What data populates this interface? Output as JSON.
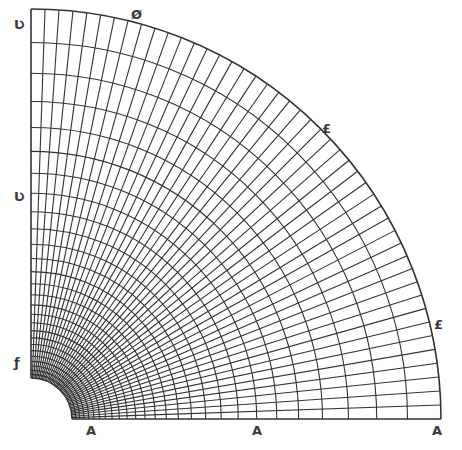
{
  "diagram": {
    "type": "polar-quarter-annulus-mesh",
    "center": [
      31,
      419
    ],
    "inner_radius": 41,
    "outer_radius": 410,
    "arc_count": 27,
    "radial_divisions": 46,
    "arc_grading_ratio": 0.917,
    "line_color": "#333333",
    "background": "#ffffff"
  },
  "markers": [
    {
      "id": "marker-top-left",
      "symbol": "Ʋ",
      "x": 14,
      "y": 18,
      "edge": "y-axis-top"
    },
    {
      "id": "marker-left-mid",
      "symbol": "Ʋ",
      "x": 14,
      "y": 190,
      "edge": "y-axis-mid"
    },
    {
      "id": "marker-left-inner",
      "symbol": "ƒ",
      "x": 14,
      "y": 356,
      "edge": "y-axis-inner"
    },
    {
      "id": "marker-bottom-inner",
      "symbol": "A",
      "x": 86,
      "y": 424,
      "edge": "x-axis-inner"
    },
    {
      "id": "marker-bottom-mid",
      "symbol": "A",
      "x": 252,
      "y": 424,
      "edge": "x-axis-mid"
    },
    {
      "id": "marker-bottom-right",
      "symbol": "A",
      "x": 432,
      "y": 424,
      "edge": "x-axis-outer"
    },
    {
      "id": "marker-arc-top",
      "symbol": "Ø",
      "x": 131,
      "y": 8,
      "edge": "outer-arc"
    },
    {
      "id": "marker-arc-upper",
      "symbol": "£",
      "x": 322,
      "y": 122,
      "edge": "outer-arc"
    },
    {
      "id": "marker-arc-lower",
      "symbol": "£",
      "x": 434,
      "y": 318,
      "edge": "outer-arc"
    }
  ]
}
